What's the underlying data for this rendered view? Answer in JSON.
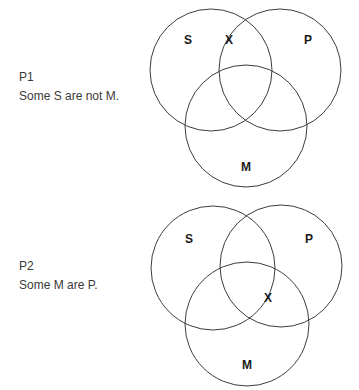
{
  "diagrams": [
    {
      "premise": {
        "name": "P1",
        "statement": "Some S are not M."
      },
      "circles": [
        {
          "label": "S",
          "cx": 211,
          "cy": 70,
          "r": 61,
          "label_x": 188,
          "label_y": 44
        },
        {
          "label": "P",
          "cx": 280,
          "cy": 70,
          "r": 61,
          "label_x": 308,
          "label_y": 44
        },
        {
          "label": "M",
          "cx": 246,
          "cy": 126,
          "r": 61,
          "label_x": 246,
          "label_y": 171
        }
      ],
      "marks": [
        {
          "symbol": "X",
          "x": 229,
          "y": 44
        }
      ]
    },
    {
      "premise": {
        "name": "P2",
        "statement": "Some M are P."
      },
      "circles": [
        {
          "label": "S",
          "cx": 213,
          "cy": 268,
          "r": 62,
          "label_x": 189,
          "label_y": 243
        },
        {
          "label": "P",
          "cx": 281,
          "cy": 266,
          "r": 61,
          "label_x": 309,
          "label_y": 243
        },
        {
          "label": "M",
          "cx": 247,
          "cy": 324,
          "r": 62,
          "label_x": 247,
          "label_y": 369
        }
      ],
      "marks": [
        {
          "symbol": "X",
          "x": 268,
          "y": 302
        }
      ]
    }
  ],
  "colors": {
    "stroke": "#3c3c3c",
    "text": "#3a3a3a"
  }
}
